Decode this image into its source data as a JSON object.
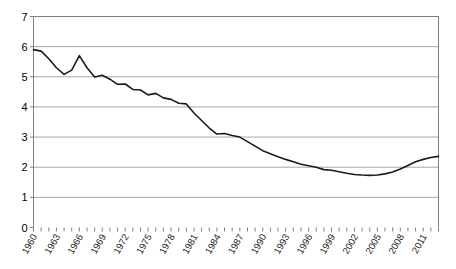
{
  "chart_data": {
    "type": "line",
    "title": "",
    "subtitle": "",
    "xlabel": "",
    "ylabel": "",
    "grid": true,
    "legend": false,
    "legend_position": "none",
    "line_color": "#1a1a1a",
    "grid_color": "#a6a6a6",
    "axis_color": "#7f7f7f",
    "background_color": "#ffffff",
    "ylim": [
      0,
      7
    ],
    "ytick_labels": [
      "0",
      "1",
      "2",
      "3",
      "4",
      "5",
      "6",
      "7"
    ],
    "ytick_values": [
      0,
      1,
      2,
      3,
      4,
      5,
      6,
      7
    ],
    "xlim": [
      1960,
      2013
    ],
    "xtick_labels": [
      "1960",
      "1963",
      "1966",
      "1969",
      "1972",
      "1975",
      "1978",
      "1981",
      "1984",
      "1987",
      "1990",
      "1993",
      "1996",
      "1999",
      "2002",
      "2005",
      "2008",
      "2011"
    ],
    "xtick_label_step": 3,
    "x": [
      1960,
      1961,
      1962,
      1963,
      1964,
      1965,
      1966,
      1967,
      1968,
      1969,
      1970,
      1971,
      1972,
      1973,
      1974,
      1975,
      1976,
      1977,
      1978,
      1979,
      1980,
      1981,
      1982,
      1983,
      1984,
      1985,
      1986,
      1987,
      1988,
      1989,
      1990,
      1991,
      1992,
      1993,
      1994,
      1995,
      1996,
      1997,
      1998,
      1999,
      2000,
      2001,
      2002,
      2003,
      2004,
      2005,
      2006,
      2007,
      2008,
      2009,
      2010,
      2011,
      2012,
      2013
    ],
    "values": [
      5.9,
      5.85,
      5.6,
      5.3,
      5.08,
      5.22,
      5.7,
      5.3,
      4.99,
      5.05,
      4.92,
      4.75,
      4.76,
      4.58,
      4.56,
      4.4,
      4.45,
      4.3,
      4.25,
      4.12,
      4.1,
      3.8,
      3.55,
      3.3,
      3.1,
      3.12,
      3.05,
      3.0,
      2.85,
      2.7,
      2.55,
      2.45,
      2.35,
      2.26,
      2.18,
      2.1,
      2.05,
      2.0,
      1.92,
      1.9,
      1.85,
      1.8,
      1.76,
      1.74,
      1.73,
      1.74,
      1.78,
      1.84,
      1.94,
      2.06,
      2.18,
      2.26,
      2.32,
      2.36
    ]
  }
}
